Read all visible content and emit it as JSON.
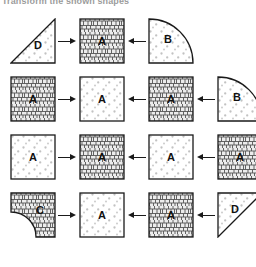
{
  "caption": {
    "text": "Transform the shown shapes"
  },
  "colors": {
    "stroke": "#1a1a1a",
    "dot_fill": "#bdbdbd",
    "brick_line": "#4d4d4d",
    "brick_bg": "#e8e8e8",
    "background": "#ffffff",
    "label": "#111111"
  },
  "legend": {
    "texture_dots": "dotted",
    "texture_brick": "brick-mesh"
  },
  "grid": {
    "rows": 4,
    "columns": 4,
    "arrow_right": "→",
    "arrow_left": "←"
  },
  "rows": [
    {
      "index": 1,
      "cells": [
        {
          "label": "D",
          "shape": "triangle-right-angle-bottom-right",
          "texture": "dotted"
        },
        {
          "label": "A",
          "shape": "square",
          "texture": "brick"
        },
        {
          "label": "B",
          "shape": "quarter-circle-arc-top-right",
          "texture": "dotted"
        }
      ],
      "arrows": [
        "right",
        "left"
      ]
    },
    {
      "index": 2,
      "cells": [
        {
          "label": "A",
          "shape": "square",
          "texture": "brick"
        },
        {
          "label": "A",
          "shape": "square",
          "texture": "dotted"
        },
        {
          "label": "A",
          "shape": "square",
          "texture": "brick"
        },
        {
          "label": "B",
          "shape": "quarter-circle-arc-top-right",
          "texture": "dotted"
        }
      ],
      "arrows": [
        "right",
        "left",
        "left"
      ]
    },
    {
      "index": 3,
      "cells": [
        {
          "label": "A",
          "shape": "square",
          "texture": "dotted"
        },
        {
          "label": "A",
          "shape": "square",
          "texture": "brick"
        },
        {
          "label": "A",
          "shape": "square",
          "texture": "dotted"
        },
        {
          "label": "A",
          "shape": "square",
          "texture": "brick"
        }
      ],
      "arrows": [
        "right",
        "left",
        "left"
      ]
    },
    {
      "index": 4,
      "cells": [
        {
          "label": "C",
          "shape": "square-minus-quarter-circle",
          "texture": "brick"
        },
        {
          "label": "A",
          "shape": "square",
          "texture": "dotted"
        },
        {
          "label": "A",
          "shape": "square",
          "texture": "brick"
        },
        {
          "label": "D",
          "shape": "triangle-right-angle-top-left",
          "texture": "dotted"
        }
      ],
      "arrows": [
        "right",
        "left",
        "left"
      ]
    }
  ]
}
